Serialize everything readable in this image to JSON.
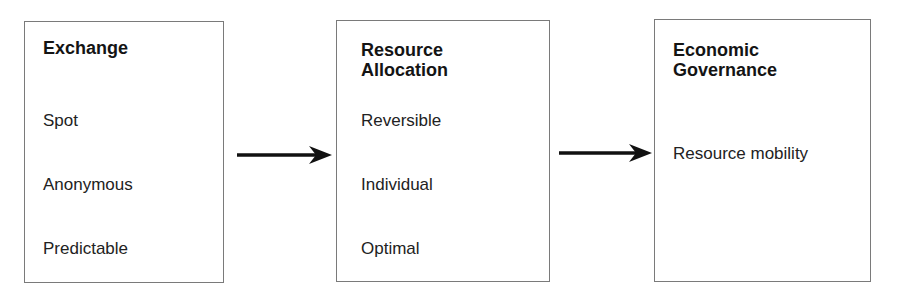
{
  "diagram": {
    "type": "flow",
    "direction": "left-to-right",
    "colors": {
      "border": "#7a7a7a",
      "arrow": "#111111",
      "text": "#1a1a1a",
      "background": "#ffffff"
    },
    "boxes": [
      {
        "title": "Exchange",
        "items": [
          "Spot",
          "Anonymous",
          "Predictable"
        ]
      },
      {
        "title": "Resource\nAllocation",
        "items": [
          "Reversible",
          "Individual",
          "Optimal"
        ]
      },
      {
        "title": "Economic\nGovernance",
        "items": [
          "Resource mobility"
        ]
      }
    ],
    "arrows": [
      {
        "from": "Exchange",
        "to": "Resource Allocation"
      },
      {
        "from": "Resource Allocation",
        "to": "Economic Governance"
      }
    ]
  }
}
